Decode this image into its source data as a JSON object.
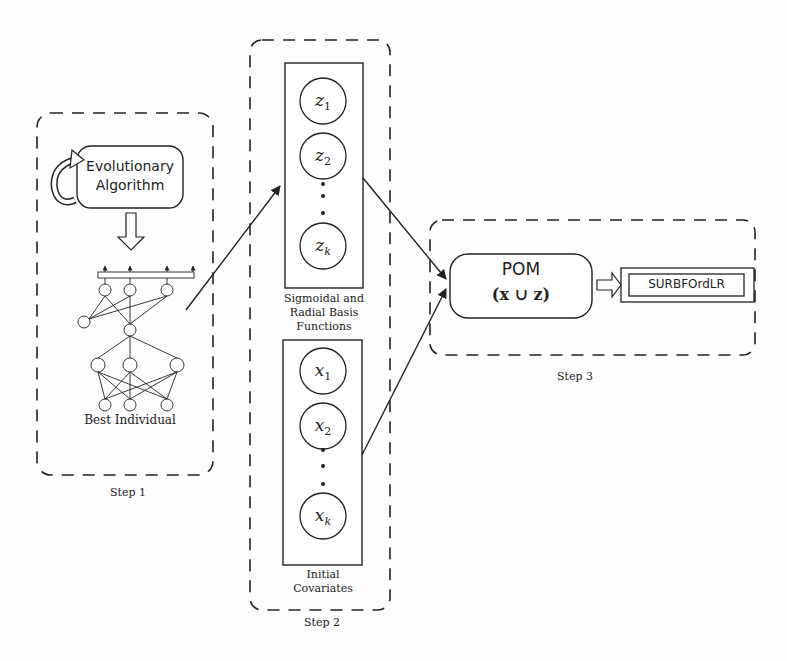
{
  "step1": {
    "label": "Step 1",
    "ea_box": {
      "line1": "Evolutionary",
      "line2": "Algorithm"
    },
    "network_caption": "Best Individual"
  },
  "step2": {
    "label": "Step 2",
    "basis_functions": {
      "nodes": [
        {
          "base": "z",
          "sub": "1"
        },
        {
          "base": "z",
          "sub": "2"
        },
        {
          "base": "z",
          "sub": "k"
        }
      ],
      "caption_lines": [
        "Sigmoidal and",
        "Radial Basis",
        "Functions"
      ]
    },
    "covariates": {
      "nodes": [
        {
          "base": "x",
          "sub": "1"
        },
        {
          "base": "x",
          "sub": "2"
        },
        {
          "base": "x",
          "sub": "k"
        }
      ],
      "caption_lines": [
        "Initial",
        "Covariates"
      ]
    }
  },
  "step3": {
    "label": "Step 3",
    "pom_box": {
      "title": "POM",
      "formula": "(x ∪ z)"
    },
    "output_box": {
      "label": "SURBFOrdLR"
    }
  },
  "colors": {
    "stroke": "#222222",
    "background": "#fdfdfd"
  }
}
